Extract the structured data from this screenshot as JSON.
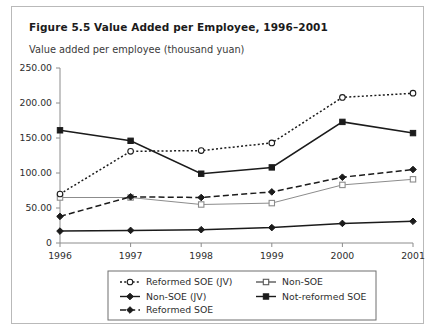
{
  "figure": {
    "title": "Figure 5.5  Value Added per Employee, 1996–2001",
    "subtitle": "Value added per employee (thousand yuan)"
  },
  "chart_data": {
    "type": "line",
    "title": "Figure 5.5  Value Added per Employee, 1996–2001",
    "subtitle": "Value added per employee (thousand yuan)",
    "xlabel": "",
    "ylabel": "Value added per employee (thousand yuan)",
    "categories": [
      "1996",
      "1997",
      "1998",
      "1999",
      "2000",
      "2001"
    ],
    "x_tick_labels": [
      "1996",
      "1997",
      "1998",
      "1999",
      "2000",
      "2001"
    ],
    "y_tick_labels": [
      "0",
      "50.00",
      "100.00",
      "150.00",
      "200.00",
      "250.00"
    ],
    "y_tick_values": [
      0,
      50,
      100,
      150,
      200,
      250
    ],
    "ylim": [
      0,
      250
    ],
    "grid": false,
    "legend_position": "bottom",
    "series": [
      {
        "name": "Reformed SOE (JV)",
        "values": [
          70,
          131,
          132,
          143,
          208,
          214
        ],
        "line_style": "dotted",
        "marker": "circle-open",
        "color": "#1b1b1b"
      },
      {
        "name": "Non-SOE (JV)",
        "values": [
          38,
          66,
          65,
          73,
          94,
          105
        ],
        "line_style": "dashed",
        "marker": "diamond-filled",
        "color": "#1b1b1b"
      },
      {
        "name": "Reformed SOE",
        "values": [
          17,
          18,
          19,
          22,
          28,
          31
        ],
        "line_style": "solid",
        "marker": "diamond-filled",
        "color": "#1b1b1b"
      },
      {
        "name": "Non-SOE",
        "values": [
          65,
          65,
          55,
          57,
          83,
          91
        ],
        "line_style": "solid",
        "marker": "square-open",
        "color": "#8c8c8c"
      },
      {
        "name": "Not-reformed SOE",
        "values": [
          161,
          146,
          99,
          108,
          173,
          157
        ],
        "line_style": "solid",
        "marker": "square-filled",
        "color": "#1b1b1b"
      }
    ]
  },
  "legend": {
    "entries": [
      {
        "label": "Reformed SOE (JV)",
        "marker": "circle-open-icon",
        "line_style": "dotted"
      },
      {
        "label": "Non-SOE (JV)",
        "marker": "diamond-filled-icon",
        "line_style": "solid"
      },
      {
        "label": "Reformed SOE",
        "marker": "diamond-filled-icon",
        "line_style": "dashed"
      },
      {
        "label": "Non-SOE",
        "marker": "square-open-icon",
        "line_style": "solid"
      },
      {
        "label": "Not-reformed SOE",
        "marker": "square-filled-icon",
        "line_style": "solid"
      }
    ]
  }
}
